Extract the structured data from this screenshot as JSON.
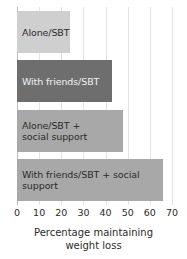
{
  "chart_data": {
    "type": "bar",
    "orientation": "horizontal",
    "title": "",
    "xlabel": "Percentage maintaining\nweight loss",
    "ylabel": "",
    "xlim": [
      0,
      70
    ],
    "xticks": [
      0,
      10,
      20,
      30,
      40,
      50,
      60,
      70
    ],
    "grid": true,
    "legend": "none",
    "categories": [
      "Alone/SBT",
      "With friends/SBT",
      "Alone/SBT +\nsocial support",
      "With friends/SBT + social support"
    ],
    "values": [
      24,
      43,
      48,
      66
    ],
    "bars": [
      {
        "label": "Alone/SBT",
        "value": 24,
        "fill": "#cfcfcf",
        "text_color": "#2b2b2b"
      },
      {
        "label": "With friends/SBT",
        "value": 43,
        "fill": "#6e6e6e",
        "text_color": "#f2f2f2"
      },
      {
        "label": "Alone/SBT +\nsocial support",
        "value": 48,
        "fill": "#a8a8a8",
        "text_color": "#2b2b2b"
      },
      {
        "label": "With friends/SBT + social support",
        "value": 66,
        "fill": "#a8a8a8",
        "text_color": "#2b2b2b"
      }
    ]
  },
  "axis": {
    "tick_labels": [
      "0",
      "10",
      "20",
      "30",
      "40",
      "50",
      "60",
      "70"
    ],
    "title": "Percentage maintaining\nweight loss"
  },
  "colors": {
    "background": "#ffffff",
    "gridline": "#e3e3e3",
    "zero_line": "#bdbdbd",
    "text": "#2b2b2b",
    "bar_light": "#cfcfcf",
    "bar_medium": "#a8a8a8",
    "bar_dark": "#6e6e6e"
  }
}
